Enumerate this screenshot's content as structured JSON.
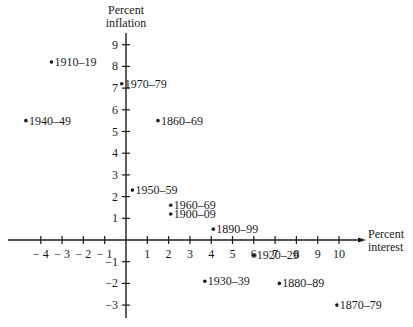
{
  "chart_data": {
    "type": "scatter",
    "title": "",
    "xlabel": "Percent interest",
    "ylabel": "Percent inflation",
    "xlim": [
      -5,
      11
    ],
    "ylim": [
      -3.5,
      9.5
    ],
    "grid": false,
    "legend": null,
    "x_ticks": [
      -4,
      -3,
      -2,
      -1,
      1,
      2,
      3,
      4,
      5,
      6,
      7,
      8,
      9,
      10
    ],
    "y_ticks": [
      -3,
      -2,
      -1,
      1,
      2,
      3,
      4,
      5,
      6,
      7,
      8,
      9
    ],
    "points": [
      {
        "label": "1910–19",
        "x": -3.5,
        "y": 8.2
      },
      {
        "label": "1970–79",
        "x": -0.2,
        "y": 7.2
      },
      {
        "label": "1940–49",
        "x": -4.7,
        "y": 5.5
      },
      {
        "label": "1860–69",
        "x": 1.5,
        "y": 5.5
      },
      {
        "label": "1950–59",
        "x": 0.3,
        "y": 2.3
      },
      {
        "label": "1960–69",
        "x": 2.1,
        "y": 1.6
      },
      {
        "label": "1900–09",
        "x": 2.1,
        "y": 1.2
      },
      {
        "label": "1890–99",
        "x": 4.1,
        "y": 0.5
      },
      {
        "label": "1920–29",
        "x": 6.0,
        "y": -0.7
      },
      {
        "label": "1930–39",
        "x": 3.7,
        "y": -1.9
      },
      {
        "label": "1880–89",
        "x": 7.2,
        "y": -2.0
      },
      {
        "label": "1870–79",
        "x": 9.9,
        "y": -3.0
      }
    ]
  },
  "axis_titles": {
    "y_line1": "Percent",
    "y_line2": "inflation",
    "x_line1": "Percent",
    "x_line2": "interest"
  },
  "colors": {
    "ink": "#1a1a1a",
    "background": "#ffffff"
  }
}
